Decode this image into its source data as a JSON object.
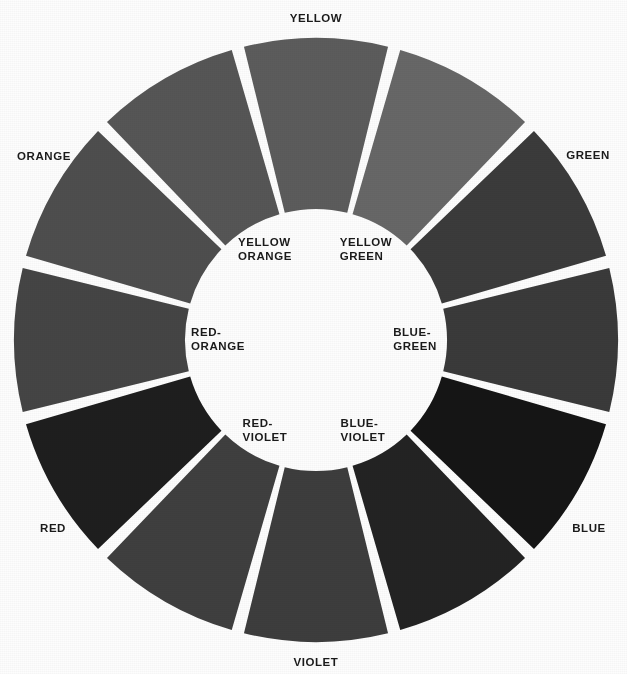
{
  "figure": {
    "kind": "color-wheel",
    "background_color": "#fdfdfd",
    "gap_color": "#ffffff",
    "label_color": "#1a1a1a",
    "center_x": 316,
    "center_y": 340,
    "outer_radius": 302,
    "inner_radius": 131,
    "gap_degrees": 2.4,
    "segment_count": 12
  },
  "chart_data": {
    "type": "pie",
    "title": "",
    "xlabel": "",
    "ylabel": "",
    "legend_position": "none",
    "grid": false,
    "note": "Twelve-part color wheel reproduced in grayscale; each wedge spans 30 degrees. Angles are measured clockwise from the top (12 o'clock).",
    "categories": [
      "YELLOW",
      "YELLOW GREEN",
      "GREEN",
      "BLUE-GREEN",
      "BLUE",
      "BLUE-VIOLET",
      "VIOLET",
      "RED-VIOLET",
      "RED",
      "RED-ORANGE",
      "ORANGE",
      "YELLOW ORANGE"
    ],
    "values": [
      30,
      30,
      30,
      30,
      30,
      30,
      30,
      30,
      30,
      30,
      30,
      30
    ],
    "segments": [
      {
        "name": "YELLOW",
        "label_ring": "outer",
        "start_deg": -15,
        "end_deg": 15,
        "gray": "#5c5c5c"
      },
      {
        "name": "YELLOW GREEN",
        "label_ring": "inner",
        "start_deg": 15,
        "end_deg": 45,
        "gray": "#676767"
      },
      {
        "name": "GREEN",
        "label_ring": "outer",
        "start_deg": 45,
        "end_deg": 75,
        "gray": "#3b3b3b"
      },
      {
        "name": "BLUE-GREEN",
        "label_ring": "inner",
        "start_deg": 75,
        "end_deg": 105,
        "gray": "#3a3a3a"
      },
      {
        "name": "BLUE",
        "label_ring": "outer",
        "start_deg": 105,
        "end_deg": 135,
        "gray": "#151515"
      },
      {
        "name": "BLUE-VIOLET",
        "label_ring": "inner",
        "start_deg": 135,
        "end_deg": 165,
        "gray": "#232323"
      },
      {
        "name": "VIOLET",
        "label_ring": "outer",
        "start_deg": 165,
        "end_deg": 195,
        "gray": "#3d3d3d"
      },
      {
        "name": "RED-VIOLET",
        "label_ring": "inner",
        "start_deg": 195,
        "end_deg": 225,
        "gray": "#3f3f3f"
      },
      {
        "name": "RED",
        "label_ring": "outer",
        "start_deg": 225,
        "end_deg": 255,
        "gray": "#1e1e1e"
      },
      {
        "name": "RED-ORANGE",
        "label_ring": "inner",
        "start_deg": 255,
        "end_deg": 285,
        "gray": "#454545"
      },
      {
        "name": "ORANGE",
        "label_ring": "outer",
        "start_deg": 285,
        "end_deg": 315,
        "gray": "#4e4e4e"
      },
      {
        "name": "YELLOW ORANGE",
        "label_ring": "inner",
        "start_deg": 315,
        "end_deg": 345,
        "gray": "#565656"
      }
    ]
  },
  "outer_labels": [
    {
      "id": "yellow",
      "text": "YELLOW",
      "x": 316,
      "y": 18,
      "align": "center"
    },
    {
      "id": "green",
      "text": "GREEN",
      "x": 588,
      "y": 155,
      "align": "center"
    },
    {
      "id": "blue",
      "text": "BLUE",
      "x": 589,
      "y": 528,
      "align": "center"
    },
    {
      "id": "violet",
      "text": "VIOLET",
      "x": 316,
      "y": 662,
      "align": "center"
    },
    {
      "id": "red",
      "text": "RED",
      "x": 53,
      "y": 528,
      "align": "center"
    },
    {
      "id": "orange",
      "text": "ORANGE",
      "x": 44,
      "y": 156,
      "align": "center"
    }
  ],
  "inner_labels": [
    {
      "id": "yellow-green",
      "line1": "YELLOW",
      "line2": "GREEN",
      "x": 366,
      "y": 249,
      "align": "left"
    },
    {
      "id": "blue-green",
      "line1": "BLUE-",
      "line2": "GREEN",
      "x": 415,
      "y": 339,
      "align": "left"
    },
    {
      "id": "blue-violet",
      "line1": "BLUE-",
      "line2": "VIOLET",
      "x": 363,
      "y": 430,
      "align": "left"
    },
    {
      "id": "red-violet",
      "line1": "RED-",
      "line2": "VIOLET",
      "x": 265,
      "y": 430,
      "align": "left"
    },
    {
      "id": "red-orange",
      "line1": "RED-",
      "line2": "ORANGE",
      "x": 218,
      "y": 339,
      "align": "left"
    },
    {
      "id": "yellow-orange",
      "line1": "YELLOW",
      "line2": "ORANGE",
      "x": 265,
      "y": 249,
      "align": "left"
    }
  ]
}
